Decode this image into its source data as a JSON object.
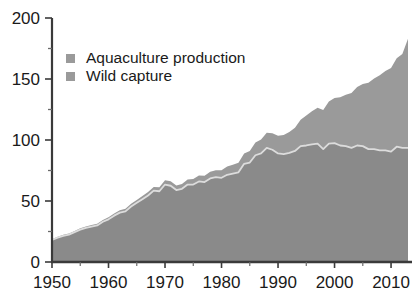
{
  "chart_data": {
    "type": "area",
    "stacked": true,
    "title": "",
    "subtitle": "",
    "xlabel": "",
    "ylabel": "",
    "xlim": [
      1950,
      2013
    ],
    "ylim": [
      0,
      200
    ],
    "xticks": [
      1950,
      1960,
      1970,
      1980,
      1990,
      2000,
      2010
    ],
    "yticks": [
      0,
      50,
      100,
      150,
      200
    ],
    "yticks_minor": [
      25,
      75,
      125,
      175
    ],
    "grid": true,
    "grid_color": "#d8d8d8",
    "legend_position": "top-left",
    "colors": {
      "aquaculture": "#9a9a9a",
      "wild_capture": "#8a8a8a",
      "boundary_line": "#dcdcdc",
      "axis": "#3a3a3a",
      "background": "#ffffff"
    },
    "x": [
      1950,
      1951,
      1952,
      1953,
      1954,
      1955,
      1956,
      1957,
      1958,
      1959,
      1960,
      1961,
      1962,
      1963,
      1964,
      1965,
      1966,
      1967,
      1968,
      1969,
      1970,
      1971,
      1972,
      1973,
      1974,
      1975,
      1976,
      1977,
      1978,
      1979,
      1980,
      1981,
      1982,
      1983,
      1984,
      1985,
      1986,
      1987,
      1988,
      1989,
      1990,
      1991,
      1992,
      1993,
      1994,
      1995,
      1996,
      1997,
      1998,
      1999,
      2000,
      2001,
      2002,
      2003,
      2004,
      2005,
      2006,
      2007,
      2008,
      2009,
      2010,
      2011,
      2012,
      2013
    ],
    "series": [
      {
        "name": "Wild capture",
        "color": "#8a8a8a",
        "values": [
          18.0,
          20.0,
          21.5,
          22.5,
          24.5,
          26.5,
          28.0,
          29.0,
          30.0,
          33.0,
          35.0,
          38.0,
          40.5,
          41.5,
          45.5,
          48.5,
          51.5,
          54.5,
          58.5,
          58.0,
          63.5,
          62.5,
          59.0,
          60.0,
          63.5,
          63.5,
          66.0,
          65.5,
          68.5,
          69.5,
          69.0,
          71.5,
          72.5,
          73.5,
          80.5,
          81.5,
          87.5,
          89.0,
          93.5,
          92.0,
          89.0,
          88.5,
          89.5,
          91.0,
          95.0,
          95.5,
          96.5,
          97.0,
          92.5,
          97.0,
          97.5,
          95.5,
          95.0,
          93.5,
          95.5,
          95.0,
          92.5,
          92.5,
          91.5,
          91.5,
          90.5,
          94.5,
          93.5,
          93.5
        ]
      },
      {
        "name": "Aquaculture production",
        "color": "#9a9a9a",
        "values": [
          0.6,
          0.7,
          0.8,
          0.9,
          1.0,
          1.1,
          1.2,
          1.3,
          1.4,
          1.5,
          1.7,
          1.8,
          1.9,
          2.1,
          2.3,
          2.4,
          2.6,
          2.8,
          3.0,
          3.2,
          3.5,
          3.6,
          3.8,
          4.0,
          4.2,
          4.5,
          4.8,
          5.1,
          5.4,
          5.8,
          6.2,
          6.7,
          7.2,
          7.8,
          8.5,
          9.5,
          10.5,
          11.5,
          12.5,
          13.5,
          14.5,
          15.5,
          17.0,
          19.0,
          21.5,
          24.5,
          27.0,
          29.5,
          32.0,
          34.5,
          37.0,
          39.5,
          42.0,
          45.0,
          48.0,
          51.0,
          54.5,
          58.0,
          61.5,
          65.0,
          68.5,
          72.5,
          77.0,
          89.5
        ]
      }
    ],
    "annotations": []
  },
  "legend": {
    "items": [
      {
        "label": "Aquaculture production",
        "swatch": "#9a9a9a"
      },
      {
        "label": "Wild capture",
        "swatch": "#9a9a9a"
      }
    ]
  },
  "axes": {
    "y_labels": [
      "200",
      "150",
      "100",
      "50",
      "0"
    ],
    "x_labels": [
      "1950",
      "1960",
      "1970",
      "1980",
      "1990",
      "2000",
      "2010"
    ]
  }
}
